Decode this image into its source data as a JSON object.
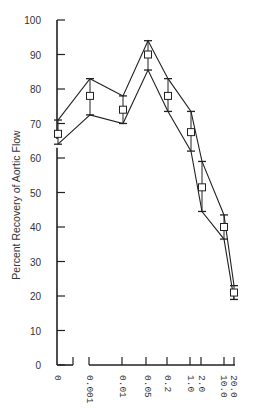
{
  "chart_data": {
    "type": "line",
    "title": "",
    "xlabel": "",
    "ylabel": "Percent Recovery of Aortic Flow",
    "ylim": [
      0,
      100
    ],
    "yticks": [
      0,
      10,
      20,
      30,
      40,
      50,
      60,
      70,
      80,
      90,
      100
    ],
    "grid": false,
    "legend": null,
    "categories": [
      "0",
      "0.001",
      "0.01",
      "0.05",
      "0.2",
      "1.0",
      "2.0",
      "10.0",
      "20.0"
    ],
    "series": [
      {
        "name": "mean",
        "marker": "open-square",
        "values": [
          67,
          78,
          74,
          90,
          78,
          67.5,
          51.5,
          40,
          21
        ]
      },
      {
        "name": "upper (mean + SE)",
        "values": [
          71,
          83,
          78,
          94,
          83,
          73.5,
          59,
          43.5,
          23
        ]
      },
      {
        "name": "lower (mean - SE)",
        "values": [
          64,
          72.5,
          70,
          85.5,
          73.5,
          62,
          44.5,
          36.5,
          19
        ]
      }
    ],
    "annotations": [
      "y-axis break between 60 and 70",
      "x-axis break between 0 and 0.001"
    ]
  },
  "layout": {
    "y0_px": 365,
    "y100_px": 20,
    "axis_x": 57,
    "x_px": [
      58,
      90,
      123,
      148,
      168,
      191,
      202,
      224,
      234
    ]
  }
}
